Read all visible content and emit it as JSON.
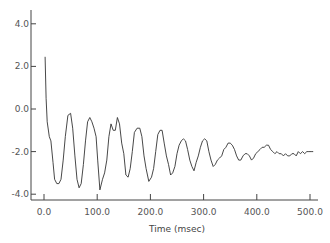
{
  "chart_data": {
    "type": "line",
    "title": "",
    "xlabel": "Time (msec)",
    "ylabel": "",
    "xlim": [
      -25,
      510
    ],
    "ylim": [
      -4.3,
      4.5
    ],
    "grid": false,
    "legend": null,
    "x_ticks": [
      0,
      100,
      200,
      300,
      400,
      500
    ],
    "x_tick_labels": [
      "0.0",
      "100.0",
      "200.0",
      "300.0",
      "400.0",
      "500.0"
    ],
    "y_ticks": [
      4,
      2,
      0,
      -2,
      -4
    ],
    "y_tick_labels": [
      "4.0",
      "2.0",
      "0.0",
      "-2.0",
      "-4.0"
    ],
    "series": [
      {
        "name": "signal",
        "color": "#333333",
        "x": [
          2,
          4,
          6,
          10,
          13,
          17,
          20,
          24,
          28,
          32,
          36,
          40,
          45,
          50,
          54,
          58,
          62,
          66,
          70,
          74,
          78,
          82,
          86,
          90,
          94,
          98,
          101,
          105,
          110,
          114,
          118,
          122,
          126,
          130,
          134,
          138,
          142,
          146,
          150,
          154,
          158,
          162,
          166,
          170,
          175,
          180,
          184,
          188,
          192,
          197,
          202,
          206,
          210,
          214,
          218,
          222,
          226,
          230,
          234,
          238,
          242,
          246,
          250,
          254,
          258,
          262,
          266,
          270,
          274,
          278,
          282,
          286,
          290,
          294,
          298,
          302,
          306,
          310,
          314,
          318,
          322,
          326,
          330,
          334,
          338,
          342,
          346,
          350,
          354,
          358,
          362,
          366,
          370,
          374,
          378,
          382,
          386,
          390,
          394,
          398,
          402,
          406,
          410,
          414,
          418,
          422,
          426,
          430,
          434,
          438,
          442,
          446,
          450,
          454,
          458,
          462,
          466,
          470,
          474,
          478,
          482,
          486,
          490,
          494,
          498,
          502,
          506
        ],
        "values": [
          2.45,
          0.5,
          -0.6,
          -1.3,
          -1.5,
          -2.5,
          -3.3,
          -3.5,
          -3.5,
          -3.3,
          -2.4,
          -1.3,
          -0.3,
          -0.2,
          -0.9,
          -2.2,
          -3.3,
          -3.7,
          -3.5,
          -2.6,
          -1.5,
          -0.6,
          -0.4,
          -0.6,
          -0.9,
          -1.3,
          -2.4,
          -3.8,
          -3.3,
          -3.0,
          -2.4,
          -1.3,
          -0.7,
          -1.0,
          -1.0,
          -0.4,
          -0.7,
          -1.6,
          -2.1,
          -3.1,
          -3.2,
          -2.8,
          -2.0,
          -1.1,
          -0.9,
          -0.9,
          -1.3,
          -2.2,
          -2.8,
          -3.4,
          -3.2,
          -2.8,
          -2.0,
          -1.2,
          -1.0,
          -1.0,
          -1.6,
          -2.2,
          -2.6,
          -3.1,
          -3.0,
          -2.7,
          -2.1,
          -1.7,
          -1.5,
          -1.4,
          -1.5,
          -1.9,
          -2.4,
          -2.7,
          -2.9,
          -2.5,
          -2.2,
          -1.8,
          -1.5,
          -1.4,
          -1.5,
          -2.0,
          -2.4,
          -2.7,
          -2.6,
          -2.4,
          -2.3,
          -2.2,
          -1.9,
          -1.8,
          -1.6,
          -1.6,
          -1.7,
          -1.9,
          -2.2,
          -2.4,
          -2.4,
          -2.2,
          -2.1,
          -2.1,
          -2.2,
          -2.4,
          -2.3,
          -2.1,
          -2.0,
          -1.9,
          -1.8,
          -1.8,
          -1.7,
          -1.7,
          -1.9,
          -2.0,
          -2.1,
          -2.0,
          -2.1,
          -2.1,
          -2.2,
          -2.1,
          -2.2,
          -2.2,
          -2.1,
          -2.1,
          -2.2,
          -2.0,
          -2.1,
          -2.0,
          -2.1,
          -2.0,
          -2.0,
          -2.0,
          -2.0
        ]
      }
    ]
  }
}
